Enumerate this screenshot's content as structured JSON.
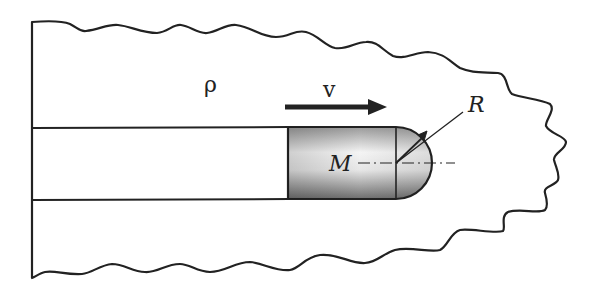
{
  "diagram": {
    "type": "physics-schematic",
    "labels": {
      "density": "ρ",
      "velocity": "v",
      "radius": "R",
      "mass": "M"
    },
    "colors": {
      "stroke": "#222222",
      "background": "#ffffff",
      "projectile_dark": "#7a7a7a",
      "projectile_light": "#f2f2f2"
    }
  }
}
